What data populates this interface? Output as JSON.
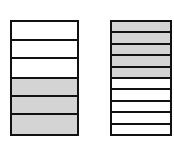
{
  "colors": {
    "border": "#111111",
    "white": "#ffffff",
    "gray": "#d4d4d4"
  },
  "diagrams": [
    {
      "name": "left-stack",
      "rows": [
        {
          "fill": "white",
          "height": 19
        },
        {
          "fill": "white",
          "height": 18
        },
        {
          "fill": "white",
          "height": 20
        },
        {
          "fill": "gray",
          "height": 19
        },
        {
          "fill": "gray",
          "height": 17
        },
        {
          "fill": "gray",
          "height": 22
        }
      ]
    },
    {
      "name": "right-stack",
      "rows": [
        {
          "fill": "gray",
          "height": 11.5
        },
        {
          "fill": "gray",
          "height": 11.5
        },
        {
          "fill": "gray",
          "height": 11.5
        },
        {
          "fill": "gray",
          "height": 11.5
        },
        {
          "fill": "gray",
          "height": 11.5
        },
        {
          "fill": "white",
          "height": 11.5
        },
        {
          "fill": "white",
          "height": 11.5
        },
        {
          "fill": "white",
          "height": 11.5
        },
        {
          "fill": "white",
          "height": 11.5
        },
        {
          "fill": "white",
          "height": 11.5
        }
      ]
    }
  ]
}
